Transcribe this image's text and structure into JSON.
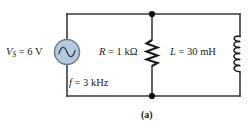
{
  "figure": {
    "caption": "(a)",
    "type": "circuit-schematic"
  },
  "colors": {
    "wire": "#3a3a3a",
    "source_fill": "#b9c9dd",
    "source_stroke": "#6d7f93",
    "text": "#1a1a1a",
    "background": "#ffffff"
  },
  "components": {
    "source": {
      "name": "voltage-source",
      "symbol": "ac-sine-source",
      "quantity": "V",
      "subscript": "S",
      "equals": "=",
      "value": "6",
      "unit": "V",
      "label": "VS = 6 V"
    },
    "frequency": {
      "name": "frequency",
      "quantity": "f",
      "equals": "=",
      "value": "3",
      "unit": "kHz",
      "label": "f = 3 kHz"
    },
    "resistor": {
      "name": "resistor",
      "symbol": "zigzag-resistor",
      "quantity": "R",
      "equals": "=",
      "value": "1",
      "unit": "kΩ",
      "label": "R = 1 kΩ"
    },
    "inductor": {
      "name": "inductor",
      "symbol": "coil-inductor",
      "quantity": "L",
      "equals": "=",
      "value": "30",
      "unit": "mH",
      "label": "L = 30 mH"
    }
  },
  "nodes": {
    "top_junction": "node-a",
    "bottom_junction": "node-b"
  }
}
